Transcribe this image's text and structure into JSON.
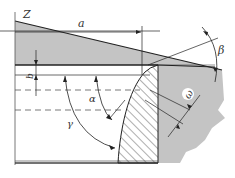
{
  "diagram": {
    "type": "engineering-cross-section",
    "labels": {
      "z": "Z",
      "a": "a",
      "b": "b",
      "alpha": "α",
      "beta": "β",
      "gamma": "γ",
      "omega": "ω"
    },
    "colors": {
      "fill_gray": "#c4c4c4",
      "line": "#222222",
      "background": "#ffffff"
    }
  }
}
